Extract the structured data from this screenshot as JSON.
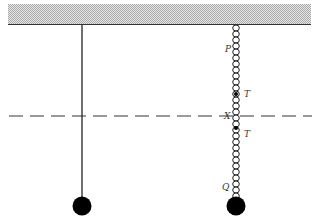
{
  "diagram": {
    "ceiling": {
      "label": "fixed support",
      "fill": "#cfcfcf"
    },
    "dashed_line_label": "X",
    "left_pendulum": {
      "description": "mass on string"
    },
    "right_pendulum": {
      "description": "mass on chain",
      "labels": {
        "top": "P",
        "upper_tension": "T",
        "middle": "X",
        "lower_tension": "T",
        "bottom": "Q"
      }
    }
  }
}
